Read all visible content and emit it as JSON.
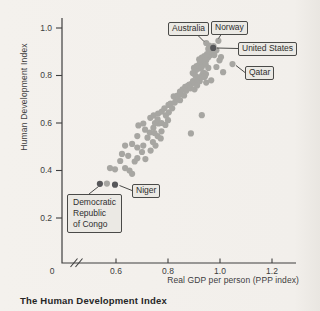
{
  "figure": {
    "caption": "The Human Development Index"
  },
  "chart_data": {
    "type": "scatter",
    "title": "The Human Development Index",
    "xlabel": "Real GDP per person (PPP index)",
    "ylabel": "Human Development Index",
    "xlim": [
      0,
      1.3
    ],
    "ylim": [
      0,
      1.05
    ],
    "x_axis_break_near_origin": true,
    "grid": false,
    "point_color": "#a7a6a2",
    "highlight_point_color": "#57575a",
    "origin_label": "0",
    "x_ticks": [
      {
        "v": 0.6,
        "label": "0.6"
      },
      {
        "v": 0.8,
        "label": "0.8"
      },
      {
        "v": 1.0,
        "label": "1.0"
      },
      {
        "v": 1.2,
        "label": "1.2"
      }
    ],
    "y_ticks": [
      {
        "v": 1.0,
        "label": "1.0"
      },
      {
        "v": 0.8,
        "label": "0.8"
      },
      {
        "v": 0.6,
        "label": "0.6"
      },
      {
        "v": 0.4,
        "label": "0.4"
      },
      {
        "v": 0.2,
        "label": "0.2"
      }
    ],
    "labeled_points": [
      {
        "label": "Australia",
        "x": 0.947,
        "y": 0.937,
        "dark": false
      },
      {
        "label": "Norway",
        "x": 0.994,
        "y": 0.946,
        "dark": false
      },
      {
        "label": "United States",
        "x": 0.974,
        "y": 0.916,
        "dark": true
      },
      {
        "label": "Qatar",
        "x": 1.048,
        "y": 0.848,
        "dark": false
      },
      {
        "label": "Niger",
        "x": 0.596,
        "y": 0.34,
        "dark": true
      },
      {
        "label": "Democratic\nRepublic\nof Congo",
        "x": 0.538,
        "y": 0.344,
        "dark": true
      }
    ],
    "points": [
      [
        0.565,
        0.345
      ],
      [
        0.577,
        0.41
      ],
      [
        0.596,
        0.405
      ],
      [
        0.635,
        0.41
      ],
      [
        0.652,
        0.4
      ],
      [
        0.662,
        0.386
      ],
      [
        0.616,
        0.44
      ],
      [
        0.623,
        0.47
      ],
      [
        0.647,
        0.462
      ],
      [
        0.682,
        0.452
      ],
      [
        0.713,
        0.448
      ],
      [
        0.672,
        0.438
      ],
      [
        0.635,
        0.505
      ],
      [
        0.662,
        0.512
      ],
      [
        0.682,
        0.497
      ],
      [
        0.705,
        0.505
      ],
      [
        0.733,
        0.484
      ],
      [
        0.752,
        0.505
      ],
      [
        0.7,
        0.478
      ],
      [
        0.682,
        0.545
      ],
      [
        0.721,
        0.538
      ],
      [
        0.76,
        0.545
      ],
      [
        0.772,
        0.535
      ],
      [
        0.742,
        0.52
      ],
      [
        0.686,
        0.59
      ],
      [
        0.705,
        0.598
      ],
      [
        0.744,
        0.58
      ],
      [
        0.764,
        0.598
      ],
      [
        0.712,
        0.572
      ],
      [
        0.73,
        0.56
      ],
      [
        0.748,
        0.558
      ],
      [
        0.775,
        0.565
      ],
      [
        0.75,
        0.6
      ],
      [
        0.79,
        0.592
      ],
      [
        0.76,
        0.615
      ],
      [
        0.775,
        0.6
      ],
      [
        0.8,
        0.612
      ],
      [
        0.732,
        0.622
      ],
      [
        0.745,
        0.632
      ],
      [
        0.762,
        0.64
      ],
      [
        0.776,
        0.648
      ],
      [
        0.792,
        0.632
      ],
      [
        0.803,
        0.645
      ],
      [
        0.786,
        0.662
      ],
      [
        0.802,
        0.676
      ],
      [
        0.816,
        0.662
      ],
      [
        0.81,
        0.682
      ],
      [
        0.826,
        0.686
      ],
      [
        0.832,
        0.7
      ],
      [
        0.846,
        0.696
      ],
      [
        0.822,
        0.712
      ],
      [
        0.836,
        0.716
      ],
      [
        0.85,
        0.722
      ],
      [
        0.862,
        0.716
      ],
      [
        0.846,
        0.732
      ],
      [
        0.856,
        0.742
      ],
      [
        0.87,
        0.736
      ],
      [
        0.866,
        0.752
      ],
      [
        0.876,
        0.756
      ],
      [
        0.886,
        0.746
      ],
      [
        0.882,
        0.762
      ],
      [
        0.892,
        0.766
      ],
      [
        0.902,
        0.742
      ],
      [
        0.888,
        0.556
      ],
      [
        0.93,
        0.633
      ],
      [
        0.896,
        0.776
      ],
      [
        0.906,
        0.772
      ],
      [
        0.912,
        0.782
      ],
      [
        0.922,
        0.776
      ],
      [
        0.916,
        0.792
      ],
      [
        0.926,
        0.792
      ],
      [
        0.932,
        0.802
      ],
      [
        0.942,
        0.796
      ],
      [
        0.936,
        0.812
      ],
      [
        0.946,
        0.806
      ],
      [
        0.908,
        0.823
      ],
      [
        0.92,
        0.83
      ],
      [
        0.927,
        0.843
      ],
      [
        0.935,
        0.855
      ],
      [
        0.947,
        0.864
      ],
      [
        0.955,
        0.877
      ],
      [
        0.963,
        0.886
      ],
      [
        0.97,
        0.898
      ],
      [
        0.978,
        0.886
      ],
      [
        0.986,
        0.906
      ],
      [
        0.955,
        0.832
      ],
      [
        0.986,
        0.836
      ],
      [
        1.012,
        0.814
      ],
      [
        0.939,
        0.794
      ],
      [
        0.966,
        0.78
      ],
      [
        0.998,
        0.864
      ],
      [
        1.004,
        0.878
      ],
      [
        0.93,
        0.862
      ],
      [
        0.94,
        0.872
      ],
      [
        0.95,
        0.89
      ],
      [
        0.96,
        0.902
      ],
      [
        0.92,
        0.846
      ],
      [
        0.91,
        0.84
      ],
      [
        0.9,
        0.832
      ],
      [
        0.895,
        0.81
      ],
      [
        0.905,
        0.8
      ],
      [
        0.93,
        0.836
      ],
      [
        0.945,
        0.846
      ],
      [
        0.94,
        0.882
      ],
      [
        0.93,
        0.876
      ],
      [
        0.92,
        0.868
      ],
      [
        0.955,
        0.912
      ],
      [
        0.965,
        0.916
      ],
      [
        0.975,
        0.924
      ],
      [
        0.958,
        0.926
      ],
      [
        0.912,
        0.758
      ],
      [
        0.947,
        0.77
      ]
    ]
  }
}
